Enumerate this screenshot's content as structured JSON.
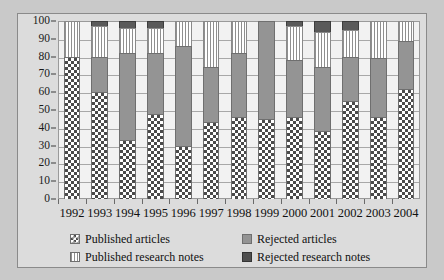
{
  "chart_data": {
    "type": "bar",
    "title": "",
    "subtitle": "",
    "xlabel": "",
    "ylabel": "",
    "stacked": true,
    "percent_stacked": true,
    "grid": true,
    "legend_position": "bottom",
    "ylim": [
      0,
      100
    ],
    "yticks": [
      0,
      10,
      20,
      30,
      40,
      50,
      60,
      70,
      80,
      90,
      100
    ],
    "ytick_labels": [
      "0",
      "10",
      "20",
      "30",
      "40",
      "50",
      "60",
      "70",
      "80",
      "90",
      "100"
    ],
    "categories": [
      "1992",
      "1993",
      "1994",
      "1995",
      "1996",
      "1997",
      "1998",
      "1999",
      "2000",
      "2001",
      "2002",
      "2003",
      "2004"
    ],
    "series": [
      {
        "name": "Published articles",
        "pattern": "checkerboard",
        "color": "#4a4a4a",
        "values": [
          80,
          60,
          33,
          48,
          30,
          43,
          46,
          45,
          46,
          38,
          55,
          46,
          62
        ]
      },
      {
        "name": "Rejected articles",
        "pattern": "solid-gray",
        "color": "#949494",
        "values": [
          0,
          20,
          49,
          34,
          56,
          31,
          36,
          55,
          32,
          36,
          25,
          33,
          27
        ]
      },
      {
        "name": "Published research notes",
        "pattern": "vertical-stripes",
        "color": "#8f8f8f",
        "values": [
          20,
          17,
          14,
          14,
          14,
          26,
          18,
          0,
          19,
          20,
          15,
          21,
          11
        ]
      },
      {
        "name": "Rejected research notes",
        "pattern": "solid-dark",
        "color": "#5a5a5a",
        "values": [
          0,
          3,
          4,
          4,
          0,
          0,
          0,
          0,
          3,
          6,
          5,
          0,
          0
        ]
      }
    ]
  },
  "legend": {
    "entries": [
      {
        "label": "Published articles",
        "swatch": "checkerboard-swatch"
      },
      {
        "label": "Rejected articles",
        "swatch": "gray-swatch"
      },
      {
        "label": "Published research notes",
        "swatch": "striped-swatch"
      },
      {
        "label": "Rejected research notes",
        "swatch": "dark-gray-swatch"
      }
    ]
  },
  "colors": {
    "background": "#c9c9c9",
    "figure_background": "#dcdcdc",
    "plot_background": "#f2f2f2",
    "gridline": "#a8a8a8",
    "axis": "#3a3a3a",
    "text": "#111111"
  }
}
